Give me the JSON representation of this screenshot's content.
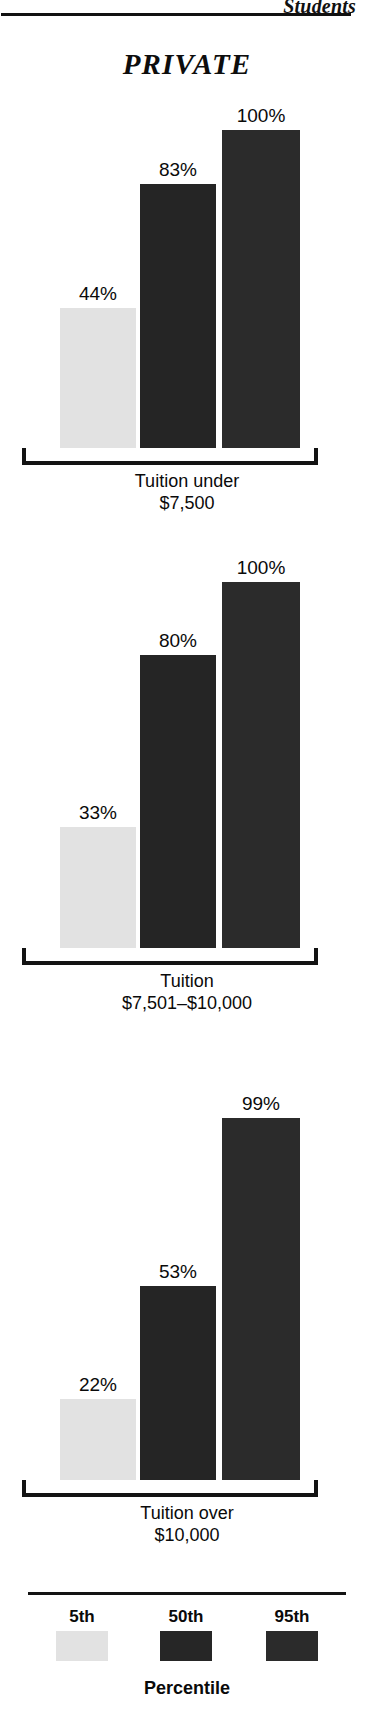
{
  "page": {
    "running_head": "Students",
    "section_title": "PRIVATE",
    "background_color": "#ffffff",
    "rule_color": "#131313"
  },
  "legend": {
    "title": "Percentile",
    "items": [
      {
        "label": "5th",
        "color": "#e2e2e2"
      },
      {
        "label": "50th",
        "color": "#262626"
      },
      {
        "label": "95th",
        "color": "#2b2b2b"
      }
    ]
  },
  "chart_data": [
    {
      "type": "bar",
      "title": "Tuition under\n$7,500",
      "caption_line1": "Tuition under",
      "caption_line2": "$7,500",
      "categories": [
        "5th",
        "50th",
        "95th"
      ],
      "values": [
        44,
        83,
        100
      ],
      "labels": [
        "44%",
        "83%",
        "100%"
      ],
      "colors": [
        "#e2e2e2",
        "#252525",
        "#2b2b2b"
      ],
      "xlabel": "Percentile",
      "ylabel": "",
      "ylim": [
        0,
        100
      ],
      "grid": false,
      "legend_position": "bottom"
    },
    {
      "type": "bar",
      "title": "Tuition\n$7,501–$10,000",
      "caption_line1": "Tuition",
      "caption_line2": "$7,501–$10,000",
      "categories": [
        "5th",
        "50th",
        "95th"
      ],
      "values": [
        33,
        80,
        100
      ],
      "labels": [
        "33%",
        "80%",
        "100%"
      ],
      "colors": [
        "#e2e2e2",
        "#252525",
        "#2b2b2b"
      ],
      "xlabel": "Percentile",
      "ylabel": "",
      "ylim": [
        0,
        100
      ],
      "grid": false,
      "legend_position": "bottom"
    },
    {
      "type": "bar",
      "title": "Tuition over\n$10,000",
      "caption_line1": "Tuition over",
      "caption_line2": "$10,000",
      "categories": [
        "5th",
        "50th",
        "95th"
      ],
      "values": [
        22,
        53,
        99
      ],
      "labels": [
        "22%",
        "53%",
        "99%"
      ],
      "colors": [
        "#e2e2e2",
        "#252525",
        "#2b2b2b"
      ],
      "xlabel": "Percentile",
      "ylabel": "",
      "ylim": [
        0,
        100
      ],
      "grid": false,
      "legend_position": "bottom"
    }
  ]
}
